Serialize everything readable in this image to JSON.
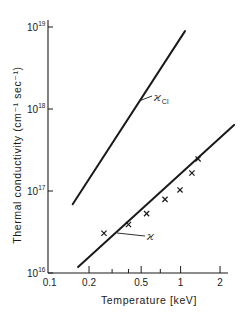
{
  "chart_data": {
    "type": "line",
    "title": "",
    "xlabel": "Temperature [keV]",
    "ylabel": "Thermal conductivity (cm⁻¹ sec⁻¹)",
    "xscale": "log",
    "yscale": "log",
    "xlim": [
      0.1,
      2.5
    ],
    "ylim": [
      1e+16,
      1e+19
    ],
    "x_ticks": [
      {
        "value": 0.1,
        "label": "0.1"
      },
      {
        "value": 0.2,
        "label": "0.2"
      },
      {
        "value": 0.3,
        "label": ""
      },
      {
        "value": 0.4,
        "label": ""
      },
      {
        "value": 0.5,
        "label": "0.5"
      },
      {
        "value": 0.7,
        "label": ""
      },
      {
        "value": 1,
        "label": "1"
      },
      {
        "value": 2,
        "label": "2"
      }
    ],
    "y_ticks": [
      {
        "value": 1e+16,
        "base": "10",
        "exp": "16"
      },
      {
        "value": 1e+17,
        "base": "10",
        "exp": "17"
      },
      {
        "value": 1e+18,
        "base": "10",
        "exp": "18"
      },
      {
        "value": 1e+19,
        "base": "10",
        "exp": "19"
      }
    ],
    "grid": false,
    "legend": "inline labels",
    "series": [
      {
        "name": "ϰ_Cl",
        "label_main": "ϰ",
        "label_sub": "Cl",
        "kind": "line",
        "x": [
          0.15,
          1.08
        ],
        "y": [
          6.9e+16,
          8.9e+18
        ]
      },
      {
        "name": "ϰ",
        "label_main": "ϰ",
        "label_sub": "",
        "kind": "line",
        "x": [
          0.165,
          2.56
        ],
        "y": [
          1.18e+16,
          6.4e+17
        ]
      },
      {
        "name": "measured",
        "kind": "scatter",
        "marker": "x",
        "x": [
          0.26,
          0.4,
          0.55,
          0.76,
          0.99,
          1.22,
          1.36
        ],
        "y": [
          3.05e+16,
          3.9e+16,
          5.3e+16,
          7.9e+16,
          1.03e+17,
          1.66e+17,
          2.46e+17
        ]
      }
    ]
  },
  "colors": {
    "ink": "#1a1a1a",
    "background": "#ffffff"
  }
}
